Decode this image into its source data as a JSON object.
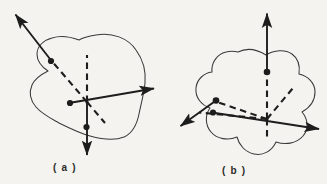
{
  "figure": {
    "background_color": "#f4f3ef",
    "ink_color": "#1d1d1d",
    "outline_color": "#3a3a3a",
    "panels": [
      {
        "id": "a",
        "caption": "( a )",
        "description": "Irregular closed body outline with three concurrent vectors through an interior origin; one solid arrow up-left, one solid arrow right, one solid arrow down, each paired with a dashed continuation line and a solid dot.",
        "origin": {
          "x": 87,
          "y": 102
        },
        "body_outline_type": "irregular-blob",
        "axes": [
          {
            "name": "up-left-axis",
            "style": "solid-arrow",
            "from": {
              "x": 87,
              "y": 102
            },
            "to": {
              "x": 14,
              "y": 13
            },
            "dashed_segment": {
              "from": {
                "x": 87,
                "y": 102
              },
              "to": {
                "x": 48,
                "y": 57
              }
            },
            "dot": {
              "x": 51,
              "y": 61
            }
          },
          {
            "name": "right-axis",
            "style": "solid-arrow",
            "from": {
              "x": 87,
              "y": 102
            },
            "to": {
              "x": 157,
              "y": 88
            },
            "dashed_segment": {
              "from": {
                "x": 87,
                "y": 102
              },
              "to": {
                "x": 104,
                "y": 122
              }
            },
            "dot": {
              "x": 70,
              "y": 103
            }
          },
          {
            "name": "down-axis",
            "style": "solid-arrow",
            "from": {
              "x": 87,
              "y": 102
            },
            "to": {
              "x": 87,
              "y": 159
            },
            "dashed_segment": {
              "from": {
                "x": 87,
                "y": 102
              },
              "to": {
                "x": 87,
                "y": 57
              }
            },
            "dot": {
              "x": 86,
              "y": 127
            }
          }
        ]
      },
      {
        "id": "b",
        "caption": "( b )",
        "description": "Irregular wavy closed body outline with three concurrent vectors through an interior origin; one solid arrow up, one solid arrow right, one solid arrow down-left, each paired with a dashed continuation line and a solid dot.",
        "origin": {
          "x": 267,
          "y": 119
        },
        "body_outline_type": "wavy-blob",
        "axes": [
          {
            "name": "up-axis",
            "style": "solid-arrow",
            "from": {
              "x": 267,
              "y": 119
            },
            "to": {
              "x": 267,
              "y": 10
            },
            "dashed_segment": {
              "from": {
                "x": 267,
                "y": 119
              },
              "to": {
                "x": 267,
                "y": 137
              }
            },
            "dot": {
              "x": 267,
              "y": 72
            }
          },
          {
            "name": "right-axis",
            "style": "solid-arrow",
            "from": {
              "x": 267,
              "y": 119
            },
            "to": {
              "x": 323,
              "y": 130
            },
            "dashed_segment": {
              "from": {
                "x": 267,
                "y": 119
              },
              "to": {
                "x": 200,
                "y": 113
              }
            },
            "dot": {
              "x": 213,
              "y": 112
            }
          },
          {
            "name": "down-left-axis",
            "style": "solid-arrow",
            "from": {
              "x": 267,
              "y": 119
            },
            "to": {
              "x": 177,
              "y": 128
            },
            "dashed_segment": {
              "from": {
                "x": 267,
                "y": 119
              },
              "to": {
                "x": 291,
                "y": 90
              }
            },
            "dot": {
              "x": 216,
              "y": 100
            }
          }
        ]
      }
    ]
  }
}
